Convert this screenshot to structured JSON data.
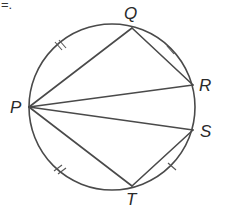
{
  "fragment_text": "=.",
  "figure": {
    "type": "circle-geometry",
    "circle": {
      "cx": 112,
      "cy": 107,
      "r": 83
    },
    "points": {
      "P": {
        "label": "P",
        "x": 29,
        "y": 107
      },
      "Q": {
        "label": "Q",
        "x": 132,
        "y": 28
      },
      "R": {
        "label": "R",
        "x": 193,
        "y": 85
      },
      "S": {
        "label": "S",
        "x": 193,
        "y": 130
      },
      "T": {
        "label": "T",
        "x": 132,
        "y": 186
      }
    },
    "chords": [
      "PQ",
      "QR",
      "PR",
      "PS",
      "ST",
      "PT"
    ],
    "arc_marks": [
      {
        "arc": "PQ",
        "ticks": 2
      },
      {
        "arc": "QR",
        "ticks": 1
      },
      {
        "arc": "ST",
        "ticks": 1
      },
      {
        "arc": "TP",
        "ticks": 2
      }
    ]
  }
}
